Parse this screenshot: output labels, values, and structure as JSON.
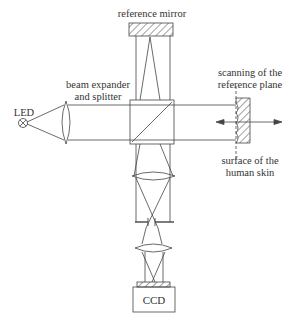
{
  "diagram": {
    "labels": {
      "reference_mirror": "reference mirror",
      "beam_expander_line1": "beam expander",
      "beam_expander_line2": "and splitter",
      "led": "LED",
      "scanning_line1": "scanning of the",
      "scanning_line2": "reference plane",
      "surface_line1": "surface of the",
      "surface_line2": "human skin",
      "ccd": "CCD"
    },
    "components": [
      {
        "id": "led",
        "icon": "led-source-icon"
      },
      {
        "id": "collimating-lens",
        "icon": "biconvex-lens-icon"
      },
      {
        "id": "beam-splitter-cube",
        "icon": "beam-splitter-icon"
      },
      {
        "id": "reference-mirror",
        "icon": "hatched-mirror-icon"
      },
      {
        "id": "skin-sample",
        "icon": "hatched-surface-icon"
      },
      {
        "id": "scan-arrow",
        "icon": "double-arrow-icon"
      },
      {
        "id": "imaging-lens-1",
        "icon": "biconvex-lens-icon"
      },
      {
        "id": "aperture",
        "icon": "aperture-stop-icon"
      },
      {
        "id": "imaging-lens-2",
        "icon": "biconvex-lens-icon"
      },
      {
        "id": "ccd-camera",
        "icon": "ccd-sensor-icon"
      }
    ],
    "colors": {
      "stroke": "#444444",
      "background": "#ffffff"
    }
  }
}
